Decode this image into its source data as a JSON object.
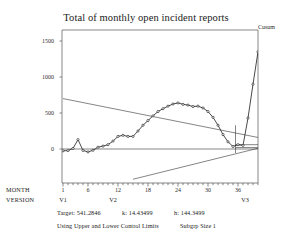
{
  "header": {
    "title": "Total of monthly open incident reports",
    "series_label": "Cusum"
  },
  "axes": {
    "y_ticks": [
      "1500",
      "1000",
      "500",
      "0"
    ],
    "x_ticks": [
      "1",
      "6",
      "12",
      "18",
      "24",
      "30",
      "36"
    ],
    "row_labels": {
      "month": "MONTH",
      "version": "VERSION"
    },
    "version_groups": [
      {
        "label": "V1"
      },
      {
        "label": "V2"
      },
      {
        "label": "V3"
      }
    ]
  },
  "footer": {
    "target_label": "Target:",
    "target_value": "541.2846",
    "k_label": "k:",
    "k_value": "14.43499",
    "h_label": "h:",
    "h_value": "144.3499",
    "limits_note": "Using Upper and Lower Control Limits",
    "subgroup_note": "Subgrp Size 1"
  },
  "colors": {
    "line": "#1a1a1a",
    "marker": "#1a1a1a",
    "axis": "#555555",
    "limit_line": "#333333",
    "background": "#ffffff"
  },
  "chart_data": {
    "type": "line",
    "title": "Total of monthly open incident reports",
    "xlabel": "MONTH",
    "ylabel": "Cusum",
    "xlim": [
      0,
      41
    ],
    "ylim": [
      -400,
      1620
    ],
    "grid": false,
    "legend": "none",
    "series": [
      {
        "name": "Cusum",
        "x": [
          1,
          2,
          3,
          4,
          5,
          6,
          7,
          8,
          9,
          10,
          11,
          12,
          13,
          14,
          15,
          16,
          17,
          18,
          19,
          20,
          21,
          22,
          23,
          24,
          25,
          26,
          27,
          28,
          29,
          30,
          31,
          32,
          33,
          34,
          35,
          36,
          37,
          38,
          39,
          40
        ],
        "values": [
          -25,
          -22,
          8,
          130,
          -20,
          -40,
          -18,
          25,
          40,
          60,
          110,
          175,
          190,
          175,
          175,
          250,
          330,
          395,
          460,
          520,
          560,
          595,
          625,
          640,
          620,
          610,
          590,
          595,
          570,
          520,
          440,
          330,
          200,
          100,
          35,
          60,
          50,
          430,
          900,
          1350
        ]
      }
    ],
    "annotations": {
      "target": 541.2846,
      "k": 14.43499,
      "h": 144.3499,
      "subgroup_size": 1,
      "limits": "Upper and Lower Control Limits",
      "upper_decision_line": {
        "x1": 1,
        "y1": 700,
        "x2": 40,
        "y2": 160
      },
      "lower_decision_line": {
        "x1": 15,
        "y1": -420,
        "x2": 40,
        "y2": 10
      },
      "reset_marker_x": 35.5,
      "zero_reference": 0
    }
  }
}
